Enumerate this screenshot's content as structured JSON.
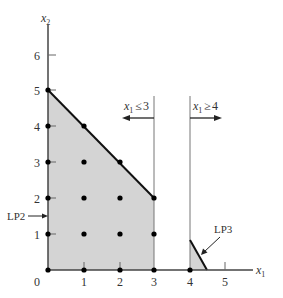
{
  "diagram": {
    "axes": {
      "x_label": "x",
      "x_label_sub": "1",
      "y_label": "x",
      "y_label_sub": "2",
      "origin_label": "0",
      "x_ticks": [
        "1",
        "2",
        "3",
        "4",
        "5"
      ],
      "y_ticks": [
        "1",
        "2",
        "3",
        "4",
        "5",
        "6"
      ]
    },
    "constraints": {
      "left": {
        "var": "x",
        "sub": "1",
        "op": "≤",
        "value": "3"
      },
      "right": {
        "var": "x",
        "sub": "1",
        "op": "≥",
        "value": "4"
      }
    },
    "regions": {
      "lp2_label": "LP2",
      "lp3_label": "LP3"
    },
    "colors": {
      "fill": "#d4d4d4",
      "boundary": "#111111",
      "axis": "#555555",
      "points": "#000000"
    },
    "lattice_points": [
      [
        0,
        0
      ],
      [
        1,
        0
      ],
      [
        2,
        0
      ],
      [
        3,
        0
      ],
      [
        4,
        0
      ],
      [
        0,
        1
      ],
      [
        1,
        1
      ],
      [
        2,
        1
      ],
      [
        3,
        1
      ],
      [
        0,
        2
      ],
      [
        1,
        2
      ],
      [
        2,
        2
      ],
      [
        3,
        2
      ],
      [
        0,
        3
      ],
      [
        1,
        3
      ],
      [
        2,
        3
      ],
      [
        0,
        4
      ],
      [
        1,
        4
      ],
      [
        0,
        5
      ]
    ]
  }
}
